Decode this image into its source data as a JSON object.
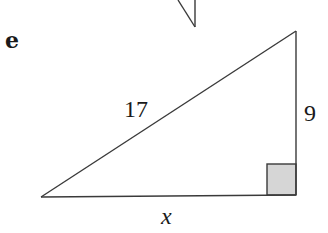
{
  "figure": {
    "part_label": "e",
    "type": "right-triangle",
    "sides": {
      "hypotenuse": "17",
      "vertical_leg": "9",
      "horizontal_leg": "x"
    },
    "right_angle_marker": "bottom-right",
    "colors": {
      "stroke": "#3a3a3a",
      "right_angle_fill": "#d6d6d6",
      "text": "#1a1a1a",
      "background": "#ffffff"
    },
    "partial_figure_above": true
  }
}
